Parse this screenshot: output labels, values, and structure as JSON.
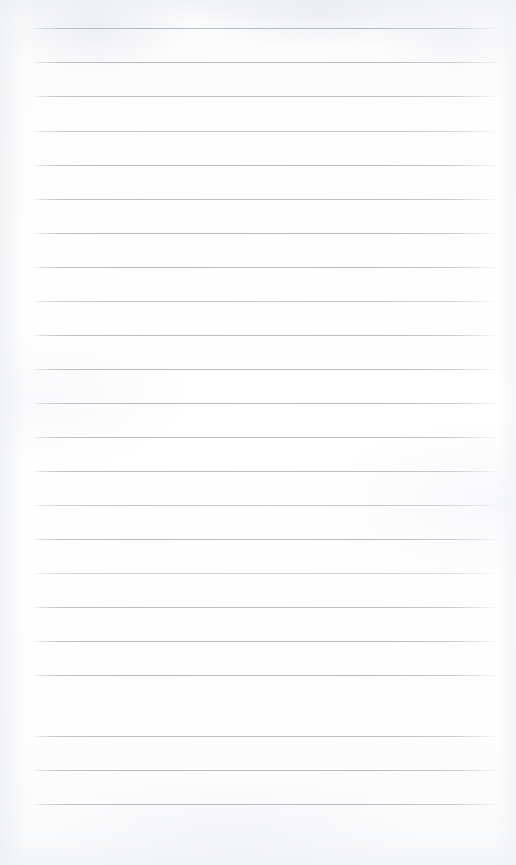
{
  "document": {
    "type": "lined-notebook-paper",
    "title": "Blank ruled notepad page",
    "content_text": "",
    "page_width_px": 516,
    "page_height_px": 865,
    "background_color": "#fdfdfd",
    "rule_color": "#b7babf",
    "rule_count": 23,
    "rule_left_px": 33,
    "rule_right_px": 500,
    "rule_first_y_px": 28,
    "rule_spacing_px": 34.2,
    "has_margin_rule": false,
    "has_punch_holes": false,
    "has_header_text": false,
    "rules": [
      {
        "index": 1,
        "y": 28,
        "left": 33,
        "right": 500,
        "weight": "normal"
      },
      {
        "index": 2,
        "y": 62,
        "left": 33,
        "right": 500,
        "weight": "normal"
      },
      {
        "index": 3,
        "y": 96,
        "left": 33,
        "right": 500,
        "weight": "normal"
      },
      {
        "index": 4,
        "y": 131,
        "left": 33,
        "right": 500,
        "weight": "faint"
      },
      {
        "index": 5,
        "y": 165,
        "left": 33,
        "right": 500,
        "weight": "normal"
      },
      {
        "index": 6,
        "y": 199,
        "left": 33,
        "right": 500,
        "weight": "normal"
      },
      {
        "index": 7,
        "y": 233,
        "left": 33,
        "right": 500,
        "weight": "normal"
      },
      {
        "index": 8,
        "y": 267,
        "left": 33,
        "right": 500,
        "weight": "normal"
      },
      {
        "index": 9,
        "y": 301,
        "left": 33,
        "right": 500,
        "weight": "faint"
      },
      {
        "index": 10,
        "y": 335,
        "left": 33,
        "right": 500,
        "weight": "normal"
      },
      {
        "index": 11,
        "y": 369,
        "left": 33,
        "right": 500,
        "weight": "normal"
      },
      {
        "index": 12,
        "y": 403,
        "left": 33,
        "right": 500,
        "weight": "normal"
      },
      {
        "index": 13,
        "y": 437,
        "left": 33,
        "right": 500,
        "weight": "normal"
      },
      {
        "index": 14,
        "y": 471,
        "left": 33,
        "right": 500,
        "weight": "normal"
      },
      {
        "index": 15,
        "y": 505,
        "left": 33,
        "right": 500,
        "weight": "faint"
      },
      {
        "index": 16,
        "y": 539,
        "left": 33,
        "right": 500,
        "weight": "normal"
      },
      {
        "index": 17,
        "y": 573,
        "left": 33,
        "right": 500,
        "weight": "extra-faint"
      },
      {
        "index": 18,
        "y": 607,
        "left": 33,
        "right": 500,
        "weight": "normal"
      },
      {
        "index": 19,
        "y": 641,
        "left": 33,
        "right": 500,
        "weight": "normal"
      },
      {
        "index": 20,
        "y": 675,
        "left": 33,
        "right": 500,
        "weight": "normal"
      },
      {
        "index": 21,
        "y": 736,
        "left": 33,
        "right": 500,
        "weight": "normal"
      },
      {
        "index": 22,
        "y": 770,
        "left": 33,
        "right": 500,
        "weight": "normal"
      },
      {
        "index": 23,
        "y": 804,
        "left": 33,
        "right": 500,
        "weight": "normal"
      }
    ]
  }
}
